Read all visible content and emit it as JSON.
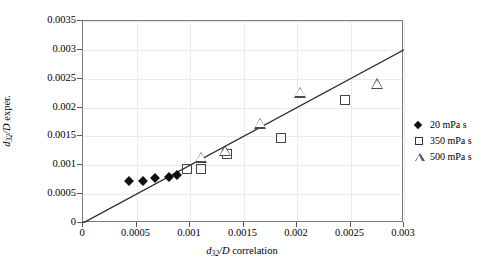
{
  "chart_data": {
    "type": "scatter",
    "title": "",
    "xlabel": "d32/D correlation",
    "ylabel": "d32/D exper.",
    "xlim": [
      0,
      0.003
    ],
    "ylim": [
      0,
      0.0035
    ],
    "xticks": [
      "0",
      "0.0005",
      "0.001",
      "0.0015",
      "0.002",
      "0.0025",
      "0.003"
    ],
    "xtick_values": [
      0,
      0.0005,
      0.001,
      0.0015,
      0.002,
      0.0025,
      0.003
    ],
    "yticks": [
      "0",
      "0.0005",
      "0.001",
      "0.0015",
      "0.002",
      "0.0025",
      "0.003",
      "0.0035"
    ],
    "ytick_values": [
      0,
      0.0005,
      0.001,
      0.0015,
      0.002,
      0.0025,
      0.003,
      0.0035
    ],
    "grid": true,
    "legend_position": "right-outside",
    "series": [
      {
        "name": "20 mPa s",
        "marker": "filled-diamond",
        "color": "#111111",
        "points": [
          {
            "x": 0.00043,
            "y": 0.00072
          },
          {
            "x": 0.00056,
            "y": 0.00072
          },
          {
            "x": 0.00067,
            "y": 0.00078
          },
          {
            "x": 0.0008,
            "y": 0.0008
          },
          {
            "x": 0.00088,
            "y": 0.00083
          }
        ]
      },
      {
        "name": "350 mPa s",
        "marker": "open-square",
        "color": "#444444",
        "points": [
          {
            "x": 0.00097,
            "y": 0.00093
          },
          {
            "x": 0.0011,
            "y": 0.00093
          },
          {
            "x": 0.00135,
            "y": 0.0012
          },
          {
            "x": 0.00185,
            "y": 0.00147
          },
          {
            "x": 0.00245,
            "y": 0.00213
          }
        ]
      },
      {
        "name": "500 mPa s",
        "marker": "open-triangle",
        "color": "#4a4a4a",
        "points": [
          {
            "x": 0.0011,
            "y": 0.00113
          },
          {
            "x": 0.00133,
            "y": 0.00143
          },
          {
            "x": 0.00165,
            "y": 0.0021
          },
          {
            "x": 0.00203,
            "y": 0.00283
          },
          {
            "x": 0.00275,
            "y": 0.00317
          }
        ]
      }
    ],
    "reference_line": {
      "name": "parity-line",
      "from": {
        "x": 0.0,
        "y": 0.0
      },
      "to": {
        "x": 0.003,
        "y": 0.003
      },
      "color": "#2b2b2b"
    }
  },
  "legend": {
    "entries": [
      {
        "label": "20 mPa s",
        "marker": "filled-diamond"
      },
      {
        "label": "350 mPa s",
        "marker": "open-square"
      },
      {
        "label": "500 mPa s",
        "marker": "open-triangle"
      }
    ]
  },
  "axis_titles": {
    "y_main": "d",
    "y_sub": "32",
    "y_rest": "/D",
    "y_tail": " exper.",
    "x_main": "d",
    "x_sub": "32",
    "x_rest": "/D",
    "x_tail": " correlation"
  }
}
